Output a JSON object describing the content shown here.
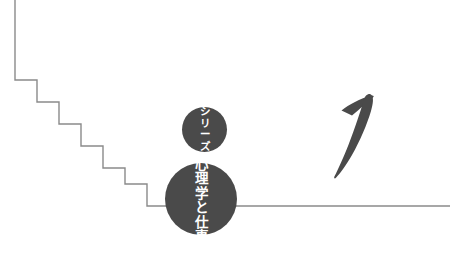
{
  "page": {
    "background_color": "#ffffff",
    "width": 458,
    "height": 271
  },
  "artwork": {
    "name": "book-cover-volume-mark",
    "line_color": "#8a8a8a",
    "circle_color": "#4a4a4a",
    "numeral_color": "#4a4a4a",
    "text_color": "#ffffff"
  },
  "staircase": {
    "name": "descending-staircase",
    "stroke_color": "#8a8a8a",
    "stroke_width": 1.4,
    "points": "15,0 15,80 37,80 37,102 59,102 59,124 81,124 81,146 103,146 103,168 125,168 125,184 147,184 147,206 450,206"
  },
  "baseline": {
    "name": "horizontal-baseline",
    "y": 206,
    "x_start": 147,
    "x_end": 450
  },
  "series_badge": {
    "name": "series-circle",
    "cx": 204.5,
    "cy": 129.5,
    "r": 22.5,
    "fill": "#4a4a4a",
    "text": "シリーズ",
    "characters": [
      "シ",
      "リ",
      "ー",
      "ズ"
    ],
    "orientation": "vertical"
  },
  "title_badge": {
    "name": "title-circle",
    "cx": 201,
    "cy": 199,
    "r": 36,
    "fill": "#4a4a4a",
    "text": "心理学と仕事",
    "characters": [
      "心",
      "理",
      "学",
      "と",
      "仕",
      "事"
    ],
    "orientation": "vertical"
  },
  "volume_numeral": {
    "name": "volume-number-one",
    "value": "1",
    "style": "calligraphic-brush",
    "fill": "#4a4a4a"
  }
}
